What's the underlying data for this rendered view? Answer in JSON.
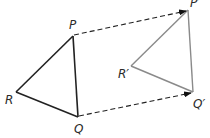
{
  "diagram": {
    "type": "translation",
    "original_triangle": {
      "vertices": [
        {
          "name": "P",
          "label": "P",
          "x": 73,
          "y": 36
        },
        {
          "name": "Q",
          "label": "Q",
          "x": 78,
          "y": 117
        },
        {
          "name": "R",
          "label": "R",
          "x": 16,
          "y": 92
        }
      ],
      "stroke": "#222222"
    },
    "image_triangle": {
      "vertices": [
        {
          "name": "P'",
          "label": "P′",
          "x": 188,
          "y": 10
        },
        {
          "name": "Q'",
          "label": "Q′",
          "x": 193,
          "y": 92
        },
        {
          "name": "R'",
          "label": "R′",
          "x": 131,
          "y": 66
        }
      ],
      "stroke": "#888888"
    },
    "translation_arrows": [
      {
        "from": "P",
        "to": "P'",
        "style": "dashed"
      },
      {
        "from": "Q",
        "to": "Q'",
        "style": "dashed"
      }
    ]
  },
  "labels": {
    "P": "P",
    "Q": "Q",
    "R": "R",
    "P_prime": "P′",
    "Q_prime": "Q′",
    "R_prime": "R′"
  }
}
